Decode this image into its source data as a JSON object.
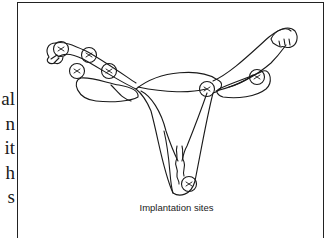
{
  "body_text": {
    "line_fragments": [
      "al",
      "n",
      "it",
      "h",
      "s"
    ]
  },
  "figure": {
    "caption": "Implantation sites",
    "diagram": "uterus-with-fallopian-tubes-and-ovaries",
    "implantation_marker_count": 7,
    "colors": {
      "line": "#1a1a1a",
      "background": "#ffffff"
    }
  }
}
